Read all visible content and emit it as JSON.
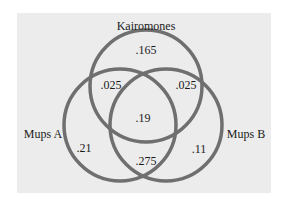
{
  "diagram": {
    "type": "venn",
    "sets": [
      {
        "name": "Kairomones",
        "cx": 146,
        "cy": 86,
        "r": 56
      },
      {
        "name": "Mups A",
        "cx": 120,
        "cy": 125,
        "r": 56
      },
      {
        "name": "Mups B",
        "cx": 166,
        "cy": 125,
        "r": 56
      }
    ],
    "labels": {
      "kairomones": "Kairomones",
      "mups_a": "Mups A",
      "mups_b": "Mups B"
    },
    "regions": {
      "kairomones_only": ".165",
      "kairomones_mups_a": ".025",
      "kairomones_mups_b": ".025",
      "all_three": ".19",
      "mups_a_only": ".21",
      "mups_b_only": ".11",
      "mups_a_mups_b": ".275"
    },
    "circle_color": "#6f6f6f",
    "background_color": "#ececec"
  }
}
